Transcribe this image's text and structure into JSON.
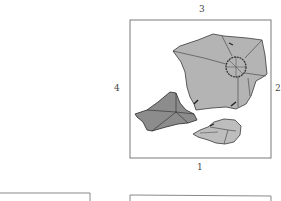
{
  "figure": {
    "frame_labels": {
      "top": "3",
      "right": "2",
      "bottom": "1",
      "left": "4"
    },
    "fragments": [
      {
        "id": "large-fragment",
        "shade": "light-gray",
        "fill": "#b4b4b4"
      },
      {
        "id": "dark-fragment",
        "shade": "dark-gray",
        "fill": "#8c8c8c"
      },
      {
        "id": "small-fragment",
        "shade": "light-gray",
        "fill": "#bdbdbd"
      }
    ],
    "colors": {
      "frame_stroke": "#707070",
      "outline": "#3a3a3a",
      "background": "#ffffff"
    }
  }
}
